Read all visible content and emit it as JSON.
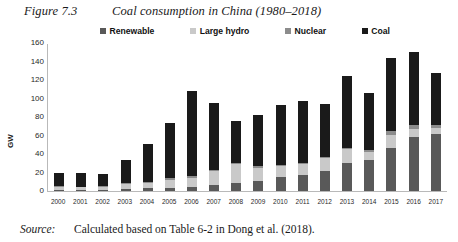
{
  "figure": {
    "label": "Figure 7.3",
    "title": "Coal consumption in China (1980–2018)"
  },
  "source": {
    "label": "Source:",
    "text": "Calculated based on Table 6-2 in Dong et al. (2018)."
  },
  "colors": {
    "renewable": "#595959",
    "large_hydro": "#c9c9c9",
    "nuclear": "#8c8c8c",
    "coal": "#1a1a1a",
    "axis": "#b9b9b9"
  },
  "chart_data": {
    "type": "bar",
    "stacked": true,
    "title": "Coal consumption in China (1980–2018)",
    "xlabel": "",
    "ylabel": "GW",
    "ylim": [
      0,
      160
    ],
    "yticks": [
      0,
      20,
      40,
      60,
      80,
      100,
      120,
      140,
      160
    ],
    "grid": false,
    "legend_position": "top",
    "categories": [
      "2000",
      "2001",
      "2002",
      "2003",
      "2004",
      "2005",
      "2006",
      "2007",
      "2008",
      "2009",
      "2010",
      "2011",
      "2012",
      "2013",
      "2014",
      "2015",
      "2016",
      "2017"
    ],
    "series": [
      {
        "name": "Renewable",
        "color": "#595959",
        "values": [
          1,
          1,
          1,
          2,
          3,
          3,
          4,
          6,
          9,
          11,
          15,
          17,
          22,
          30,
          34,
          47,
          58,
          62
        ]
      },
      {
        "name": "Large hydro",
        "color": "#c9c9c9",
        "values": [
          3,
          3,
          3,
          6,
          6,
          9,
          10,
          16,
          20,
          14,
          12,
          12,
          14,
          15,
          8,
          14,
          9,
          6
        ]
      },
      {
        "name": "Nuclear",
        "color": "#8c8c8c",
        "values": [
          1,
          0,
          1,
          1,
          1,
          2,
          2,
          1,
          1,
          2,
          1,
          1,
          1,
          2,
          2,
          4,
          4,
          3
        ]
      },
      {
        "name": "Coal",
        "color": "#1a1a1a",
        "values": [
          15,
          15,
          13,
          25,
          41,
          60,
          92,
          72,
          46,
          55,
          65,
          67,
          57,
          77,
          62,
          79,
          79,
          57
        ]
      }
    ],
    "totals": [
      20,
      19,
      18,
      34,
      51,
      74,
      108,
      95,
      76,
      82,
      93,
      97,
      94,
      124,
      106,
      144,
      150,
      128
    ]
  }
}
